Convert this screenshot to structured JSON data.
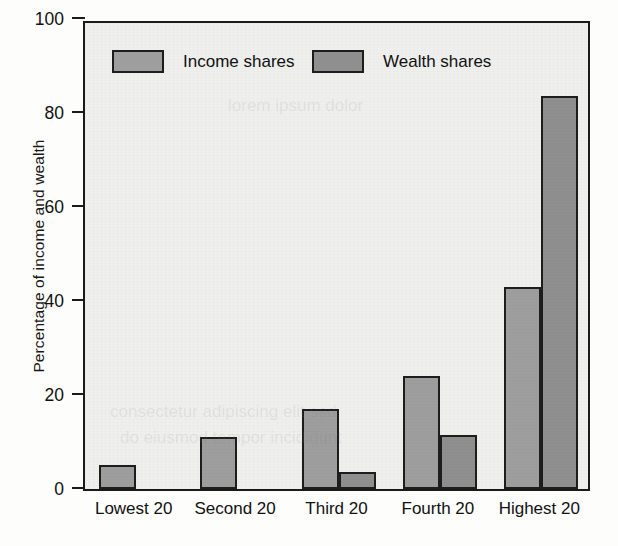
{
  "chart_data": {
    "type": "bar",
    "title": "",
    "subtitle": "",
    "xlabel": "",
    "ylabel": "Percentage of income and wealth",
    "categories": [
      "Lowest 20",
      "Second 20",
      "Third 20",
      "Fourth 20",
      "Highest 20"
    ],
    "series": [
      {
        "name": "Income shares",
        "color": "#9e9e9e",
        "values": [
          4.5,
          10.5,
          16.5,
          23.5,
          42.5
        ]
      },
      {
        "name": "Wealth shares",
        "color": "#8f8f8f",
        "values": [
          0,
          0,
          3.0,
          11.0,
          83.0
        ]
      }
    ],
    "ylim": [
      0,
      100
    ],
    "yticks": [
      0,
      20,
      40,
      60,
      80,
      100
    ],
    "ytick_labels": [
      "0",
      "20",
      "40",
      "60",
      "80",
      "100"
    ],
    "grid": false,
    "legend_position": "top-inside",
    "legend": [
      {
        "label": "Income shares",
        "swatch": "income"
      },
      {
        "label": "Wealth shares",
        "swatch": "wealth"
      }
    ]
  },
  "colors": {
    "income_bar": "#9e9e9e",
    "wealth_bar": "#8f8f8f",
    "plot_background": "#efefed",
    "axis_line": "#1a1a1a",
    "text": "#111111"
  }
}
